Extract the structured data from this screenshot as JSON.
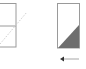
{
  "diagram": {
    "left_panel": {
      "label": "",
      "stroke": "#9a9a9a",
      "divider": true
    },
    "diagonal_line": {
      "style": "dotted",
      "color": "#c8c8c8"
    },
    "right_panel": {
      "stroke": "#9a9a9a",
      "fill_triangle": "#6e6e6e"
    },
    "arrow": {
      "direction": "left",
      "color": "#bdbdbd",
      "head_color": "#333333"
    }
  }
}
